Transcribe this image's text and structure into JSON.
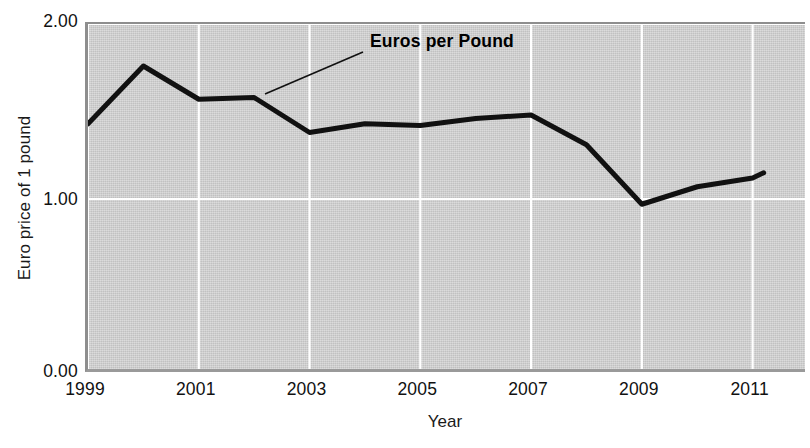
{
  "chart_data": {
    "type": "line",
    "title": "",
    "xlabel": "Year",
    "ylabel": "Euro price of 1 pound",
    "xlim": [
      1999,
      2012
    ],
    "ylim": [
      0.0,
      2.0
    ],
    "grid": true,
    "legend_position": "inline-annotation",
    "y_ticks": [
      "0.00",
      "1.00",
      "2.00"
    ],
    "y_tick_values": [
      0.0,
      1.0,
      2.0
    ],
    "x_ticks": [
      "1999",
      "2001",
      "2003",
      "2005",
      "2007",
      "2009",
      "2011"
    ],
    "x_tick_values": [
      1999,
      2001,
      2003,
      2005,
      2007,
      2009,
      2011
    ],
    "series": [
      {
        "name": "Euros per Pound",
        "color": "#111111",
        "x": [
          1999,
          2000,
          2001,
          2002,
          2003,
          2004,
          2005,
          2006,
          2007,
          2008,
          2009,
          2010,
          2011,
          2011.2
        ],
        "values": [
          1.43,
          1.76,
          1.57,
          1.58,
          1.38,
          1.43,
          1.42,
          1.46,
          1.48,
          1.31,
          0.97,
          1.07,
          1.12,
          1.15
        ]
      }
    ],
    "annotations": [
      {
        "text": "Euros per Pound",
        "label_x": 370,
        "label_y": 31,
        "leader_from": [
          262,
          92
        ],
        "leader_to": [
          360,
          50
        ]
      }
    ],
    "colors": {
      "plot_background": "#cdcdcd",
      "gridline": "#ffffff",
      "axis_border": "#8e8e8e",
      "line": "#111111",
      "text": "#111111"
    }
  },
  "axes": {
    "y_title": "Euro price of 1 pound",
    "x_title": "Year",
    "y_tick_labels": [
      "2.00",
      "1.00",
      "0.00"
    ],
    "x_tick_labels": [
      "1999",
      "2001",
      "2003",
      "2005",
      "2007",
      "2009",
      "2011"
    ]
  },
  "annotation": {
    "series_label": "Euros per Pound"
  }
}
